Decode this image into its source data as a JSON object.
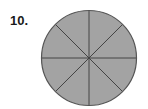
{
  "problem": {
    "number_label": "10."
  },
  "figure": {
    "shape": "circle",
    "equal_parts": 8,
    "shaded_parts": 8,
    "center": [
      89,
      58
    ],
    "radius": 47.5,
    "fill_color": "#a3a3a3",
    "line_color": "#444444",
    "outline_color": "#555555"
  }
}
